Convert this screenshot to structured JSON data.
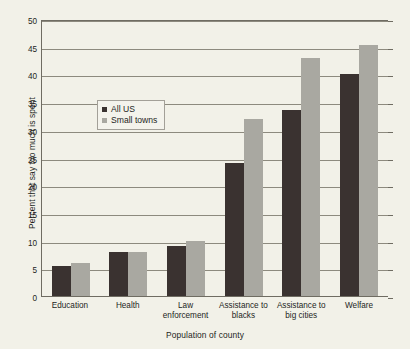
{
  "chart_data": {
    "type": "bar",
    "title": "",
    "xlabel": "Population of county",
    "ylabel": "Percent that say too much is spent",
    "categories": [
      "Education",
      "Health",
      "Law enforcement",
      "Assistance to blacks",
      "Assistance to big cities",
      "Welfare"
    ],
    "series": [
      {
        "name": "All US",
        "color": "#3a3230",
        "values": [
          5.5,
          8.0,
          9.0,
          24.0,
          33.5,
          40.0
        ]
      },
      {
        "name": "Small towns",
        "color": "#a9a8a1",
        "values": [
          6.0,
          8.0,
          10.0,
          32.0,
          43.0,
          45.3
        ]
      }
    ],
    "ylim": [
      0,
      50
    ],
    "yticks": [
      0,
      5,
      10,
      15,
      20,
      25,
      30,
      35,
      40,
      45,
      50
    ],
    "ytick_labels": [
      "0",
      "5",
      "10",
      "15",
      "20",
      "25",
      "30",
      "35",
      "40",
      "45",
      "50"
    ],
    "grid": true,
    "legend_position": "upper-left-inside"
  },
  "legend": {
    "entries": [
      {
        "label": "All US"
      },
      {
        "label": "Small towns"
      }
    ]
  }
}
